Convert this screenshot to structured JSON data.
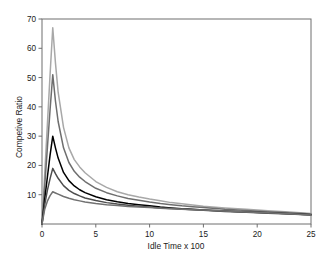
{
  "chart_data": {
    "type": "line",
    "title": "",
    "xlabel": "Idle Time x 100",
    "ylabel": "Competive Ratio",
    "xlim": [
      0,
      25
    ],
    "ylim": [
      0,
      70
    ],
    "xticks": [
      0,
      5,
      10,
      15,
      20,
      25
    ],
    "yticks": [
      10,
      20,
      30,
      40,
      50,
      60,
      70
    ],
    "grid": false,
    "legend": "none",
    "x": [
      0,
      0.25,
      0.5,
      0.75,
      1,
      1.25,
      1.5,
      2,
      2.5,
      3,
      3.5,
      4,
      5,
      6,
      7,
      8,
      9,
      10,
      11,
      12,
      13,
      14,
      15,
      17,
      19,
      21,
      23,
      25
    ],
    "series": [
      {
        "name": "series-1",
        "color": "#a8a8a8",
        "peak_x": 1,
        "peak_y": 67,
        "values": [
          0,
          17,
          34,
          51,
          67,
          55,
          45,
          33,
          26,
          22,
          19.5,
          17.5,
          14.5,
          12.5,
          11,
          10,
          9.2,
          8.5,
          7.9,
          7.3,
          6.9,
          6.5,
          6.1,
          5.5,
          5,
          4.5,
          4.1,
          3.6
        ]
      },
      {
        "name": "series-2",
        "color": "#6e6e6e",
        "peak_x": 1,
        "peak_y": 51,
        "values": [
          0,
          13,
          26,
          39,
          51,
          42,
          35,
          26,
          21,
          18,
          16,
          14.5,
          12.2,
          10.7,
          9.6,
          8.7,
          8.1,
          7.5,
          7,
          6.6,
          6.2,
          5.9,
          5.6,
          5,
          4.6,
          4.2,
          3.8,
          3.4
        ]
      },
      {
        "name": "series-3",
        "color": "#000000",
        "peak_x": 1,
        "peak_y": 30,
        "values": [
          0,
          8.5,
          16,
          23.5,
          30,
          26,
          22.5,
          17.6,
          14.8,
          13,
          11.7,
          10.7,
          9.3,
          8.3,
          7.6,
          7,
          6.6,
          6.2,
          5.8,
          5.5,
          5.2,
          5,
          4.8,
          4.4,
          4.1,
          3.8,
          3.5,
          3.2
        ]
      },
      {
        "name": "series-4",
        "color": "#4d4d4d",
        "peak_x": 1,
        "peak_y": 19,
        "values": [
          0,
          6.5,
          11.5,
          15.5,
          19,
          17.2,
          15.6,
          13.1,
          11.5,
          10.4,
          9.6,
          8.9,
          8,
          7.3,
          6.8,
          6.4,
          6.1,
          5.8,
          5.5,
          5.3,
          5.1,
          4.9,
          4.7,
          4.3,
          4,
          3.7,
          3.4,
          3.1
        ]
      },
      {
        "name": "series-5",
        "color": "#717171",
        "peak_x": 1,
        "peak_y": 11,
        "values": [
          0,
          5,
          7.8,
          9.7,
          11,
          10.6,
          10.2,
          9.4,
          8.8,
          8.3,
          7.9,
          7.5,
          7,
          6.6,
          6.3,
          6,
          5.8,
          5.6,
          5.4,
          5.2,
          5.05,
          4.9,
          4.75,
          4.4,
          4.1,
          3.8,
          3.5,
          3.1
        ]
      }
    ]
  },
  "axes": {
    "x_tick_labels": [
      "0",
      "5",
      "10",
      "15",
      "20",
      "25"
    ],
    "y_tick_labels": [
      "10",
      "20",
      "30",
      "40",
      "50",
      "60",
      "70"
    ],
    "x_title": "Idle Time x 100",
    "y_title": "Competive Ratio"
  }
}
